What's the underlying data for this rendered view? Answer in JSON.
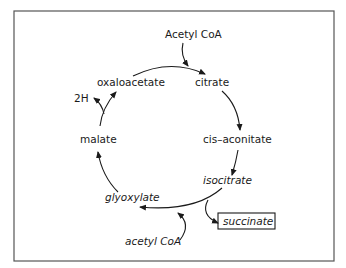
{
  "diagram": {
    "type": "metabolic-cycle",
    "nodes": {
      "acetyl_coa_top": "Acetyl CoA",
      "citrate": "citrate",
      "cis_aconitate": "cis–aconitate",
      "isocitrate": "isocitrate",
      "succinate": "succinate",
      "acetyl_coa_bottom": "acetyl CoA",
      "glyoxylate": "glyoxylate",
      "malate": "malate",
      "two_h": "2H",
      "oxaloacetate": "oxaloacetate"
    },
    "edges": [
      {
        "from": "oxaloacetate",
        "to": "citrate",
        "input": "Acetyl CoA"
      },
      {
        "from": "citrate",
        "to": "cis-aconitate"
      },
      {
        "from": "cis-aconitate",
        "to": "isocitrate"
      },
      {
        "from": "isocitrate",
        "to": "glyoxylate",
        "output": "succinate"
      },
      {
        "from": "glyoxylate",
        "to": "malate",
        "input": "acetyl CoA"
      },
      {
        "from": "malate",
        "to": "oxaloacetate",
        "output": "2H"
      }
    ]
  }
}
